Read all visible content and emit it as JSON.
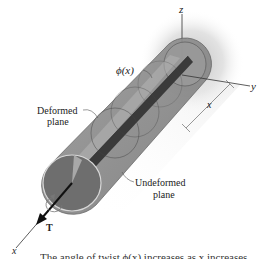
{
  "figure": {
    "type": "torsion-shaft-diagram",
    "axes": {
      "x_label": "x",
      "y_label": "y",
      "z_label": "z"
    },
    "labels": {
      "angle": "ϕ(x)",
      "deformed_line1": "Deformed",
      "deformed_line2": "plane",
      "undeformed_line1": "Undeformed",
      "undeformed_line2": "plane",
      "distance": "x",
      "torque": "T"
    },
    "caption": "The angle of twist ϕ(x) increases as x increases.",
    "colors": {
      "shaft_body": "#8a8a8a",
      "shaft_top": "#a9a9a9",
      "front_face": "#6e6e6e",
      "slit": "#3a3a3a",
      "glow": "#c8c8c8",
      "line": "#333333"
    }
  }
}
